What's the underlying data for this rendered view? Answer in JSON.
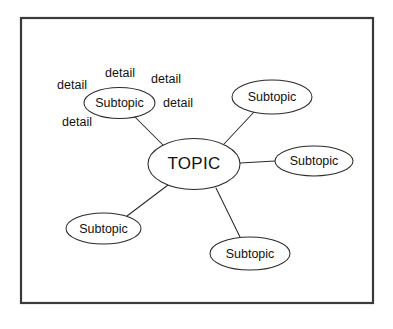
{
  "diagram": {
    "type": "mind-map",
    "title_node": {
      "label": "TOPIC",
      "cx": 194,
      "cy": 164,
      "rx": 46,
      "ry": 25.5
    },
    "frame": {
      "x": 21,
      "y": 18,
      "width": 352,
      "height": 285,
      "stroke": "#3a3a3a"
    },
    "colors": {
      "background": "#ffffff",
      "stroke": "#2b2b2b",
      "frame_stroke": "#3a3a3a",
      "text": "#111111"
    },
    "subtopics": [
      {
        "id": "subtopic-top-left",
        "label": "Subtopic",
        "cx": 119.5,
        "cy": 103,
        "rx": 35.5,
        "ry": 15.5
      },
      {
        "id": "subtopic-top-right",
        "label": "Subtopic",
        "cx": 272,
        "cy": 97,
        "rx": 40,
        "ry": 17
      },
      {
        "id": "subtopic-right",
        "label": "Subtopic",
        "cx": 314,
        "cy": 161,
        "rx": 39,
        "ry": 15
      },
      {
        "id": "subtopic-bottom-center",
        "label": "Subtopic",
        "cx": 250,
        "cy": 253.5,
        "rx": 40,
        "ry": 16.5
      },
      {
        "id": "subtopic-bottom-left",
        "label": "Subtopic",
        "cx": 103.5,
        "cy": 228.5,
        "rx": 37.5,
        "ry": 15.5
      }
    ],
    "details": [
      {
        "id": "detail-top",
        "label": "detail",
        "x": 120,
        "y": 74
      },
      {
        "id": "detail-top-right",
        "label": "detail",
        "x": 166,
        "y": 80
      },
      {
        "id": "detail-left",
        "label": "detail",
        "x": 72,
        "y": 86
      },
      {
        "id": "detail-right",
        "label": "detail",
        "x": 178,
        "y": 104
      },
      {
        "id": "detail-bottom-left",
        "label": "detail",
        "x": 77,
        "y": 123
      }
    ],
    "connectors": [
      {
        "id": "connector-topic-to-top-left",
        "x1": 163,
        "y1": 145,
        "x2": 135,
        "y2": 117
      },
      {
        "id": "connector-topic-to-top-right",
        "x1": 224,
        "y1": 144,
        "x2": 254,
        "y2": 112
      },
      {
        "id": "connector-topic-to-right",
        "x1": 240,
        "y1": 163,
        "x2": 275,
        "y2": 161
      },
      {
        "id": "connector-topic-to-bottom-center",
        "x1": 216,
        "y1": 188,
        "x2": 240,
        "y2": 237
      },
      {
        "id": "connector-topic-to-bottom-left",
        "x1": 168,
        "y1": 185,
        "x2": 127,
        "y2": 216
      }
    ]
  }
}
